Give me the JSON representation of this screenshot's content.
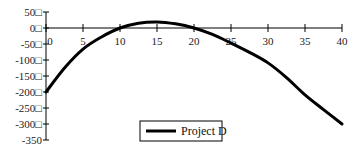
{
  "chart_data": {
    "type": "line",
    "title": "",
    "xlabel": "",
    "ylabel": "",
    "xlim": [
      0,
      40
    ],
    "ylim": [
      -350,
      50
    ],
    "grid": false,
    "legend_position": "bottom-center",
    "x_ticks": [
      0,
      5,
      10,
      15,
      20,
      25,
      30,
      35,
      40
    ],
    "x_tick_labels": [
      "0",
      "5",
      "10",
      "15",
      "20",
      "25",
      "30",
      "35",
      "40"
    ],
    "y_ticks": [
      50,
      0,
      -50,
      -100,
      -150,
      -200,
      -250,
      -300,
      -350
    ],
    "y_tick_labels": [
      "50□",
      "0□",
      "-50□",
      "-100□",
      "-150□",
      "-200□",
      "-250□",
      "-300□",
      "-350"
    ],
    "x": [
      0,
      2.5,
      5,
      7.5,
      10,
      12.5,
      15,
      17.5,
      20,
      22.5,
      25,
      27.5,
      30,
      32.5,
      35,
      37.5,
      40
    ],
    "series": [
      {
        "name": "Project D",
        "color": "#000000",
        "values": [
          -200,
          -125,
          -66,
          -28,
          0,
          15,
          19,
          13,
          0,
          -20,
          -47,
          -76,
          -109,
          -155,
          -209,
          -255,
          -300
        ]
      }
    ]
  },
  "legend": {
    "items": [
      {
        "label": "Project D",
        "color": "#000000"
      }
    ]
  }
}
